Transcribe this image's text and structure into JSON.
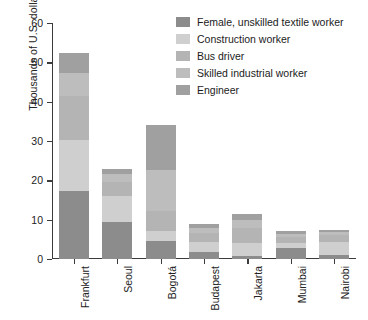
{
  "chart_data": {
    "type": "bar",
    "subtype": "stacked-bar",
    "title": "",
    "xlabel": "",
    "ylabel": "Thousands of U.S. dollars per year",
    "ylim": [
      0,
      60
    ],
    "yticks": [
      0,
      10,
      20,
      30,
      40,
      50,
      60
    ],
    "grid": false,
    "legend_position": "top-right",
    "categories": [
      "Frankfurt",
      "Seoul",
      "Bogotá",
      "Budapest",
      "Jakarta",
      "Mumbai",
      "Nairobi"
    ],
    "series": [
      {
        "name": "Female, unskilled textile worker",
        "color": "#8c8c8c",
        "values": [
          17.2,
          9.5,
          4.5,
          1.8,
          0.8,
          2.9,
          1.1
        ]
      },
      {
        "name": "Construction worker",
        "color": "#cfcfcf",
        "values": [
          13.0,
          6.5,
          2.5,
          2.4,
          3.4,
          1.2,
          3.2
        ]
      },
      {
        "name": "Bus driver",
        "color": "#b4b4b4",
        "values": [
          11.2,
          3.6,
          5.2,
          2.5,
          3.6,
          1.5,
          1.7
        ]
      },
      {
        "name": "Skilled industrial worker",
        "color": "#bdbdbd",
        "values": [
          6.0,
          2.0,
          10.4,
          1.3,
          2.1,
          0.8,
          0.8
        ]
      },
      {
        "name": "Engineer",
        "color": "#a0a0a0",
        "values": [
          5.1,
          1.4,
          11.4,
          1.0,
          1.6,
          0.6,
          0.7
        ]
      }
    ],
    "totals": [
      52.5,
      23.0,
      34.0,
      9.0,
      11.5,
      7.0,
      7.5
    ]
  },
  "legend": {
    "items": [
      {
        "label": "Female, unskilled textile worker",
        "swatch": "legend-swatch-female-unskilled-textile-worker"
      },
      {
        "label": "Construction worker",
        "swatch": "legend-swatch-construction-worker"
      },
      {
        "label": "Bus driver",
        "swatch": "legend-swatch-bus-driver"
      },
      {
        "label": "Skilled industrial worker",
        "swatch": "legend-swatch-skilled-industrial-worker"
      },
      {
        "label": "Engineer",
        "swatch": "legend-swatch-engineer"
      }
    ]
  },
  "axes": {
    "y_title": "Thousands of U.S. dollars per year",
    "y_tick_labels": [
      "0",
      "10",
      "20",
      "30",
      "40",
      "50",
      "60"
    ],
    "x_tick_labels": [
      "Frankfurt",
      "Seoul",
      "Bogotá",
      "Budapest",
      "Jakarta",
      "Mumbai",
      "Nairobi"
    ]
  },
  "colors": {
    "axis": "#3b3b3b",
    "text": "#232323",
    "background": "#ffffff"
  }
}
